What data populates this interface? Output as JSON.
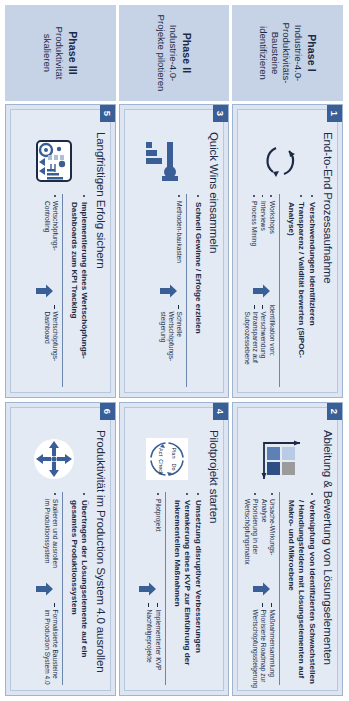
{
  "diagram": {
    "colors": {
      "panel_bg": "#e3eaf4",
      "panel_border": "#9fb4d0",
      "phase_label_bg": "#c6d3e6",
      "badge_bg": "#3a5f96",
      "accent": "#3a5f96",
      "divider": "#6d86ad",
      "text": "#1b2b46"
    },
    "phases": [
      {
        "id": "phase-1",
        "title": "Phase I",
        "subtitle": "Industrie-4.0-Produktivitäts-Bausteine identifizieren",
        "cards": [
          {
            "number": "1",
            "title": "End-to-End Prozessaufnahme",
            "icon": "cycle-arrows-icon",
            "bullets": [
              "Verschwendungen identifizieren",
              "Transparenz / Validität bewerten (SIPOC-Analyse)"
            ],
            "sub_left": [
              "Workshops",
              "Interviews",
              "Process Mining"
            ],
            "sub_left_style": "dot",
            "sub_right_heading": "Identifikation von:",
            "sub_right": [
              "Verschwendung",
              "Intransparenz auf Subprozessebene"
            ],
            "sub_right_style": "dash"
          },
          {
            "number": "2",
            "title": "Ableitung & Bewertung von Lösungselementen",
            "icon": "matrix-quadrant-icon",
            "bullets": [
              "Verknüpfung von identifizierten Schwachstellen / Handlungsfeldern mit Lösungselementen auf Makro- und Mikroebene"
            ],
            "sub_left": [
              "Ursache-Wirkungs-Analyse",
              "Priorisierung in der Wertschöpfungsmatrix"
            ],
            "sub_left_style": "dot",
            "sub_right_heading": "",
            "sub_right": [
              "Maßnahmensammlung",
              "Priorisierte Roadmap zur Wertschöpfungssteigerung"
            ],
            "sub_right_style": "dash"
          }
        ]
      },
      {
        "id": "phase-2",
        "title": "Phase II",
        "subtitle": "Industrie-4.0-Projekte pilotieren",
        "cards": [
          {
            "number": "3",
            "title": "Quick Wins einsammeln",
            "icon": "hammer-bars-icon",
            "bullets": [
              "Schnell Gewinne / Erfolge erzielen"
            ],
            "sub_left": [
              "Methoden-baukasten"
            ],
            "sub_left_style": "dot",
            "sub_right_heading": "",
            "sub_right": [
              "Schnelle Wertschöpfungs-steigerung"
            ],
            "sub_right_style": "dash"
          },
          {
            "number": "4",
            "title": "Pilotprojekt starten",
            "icon": "pdca-cycle-icon",
            "bullets": [
              "Umsetzung disruptiver Verbesserungen",
              "Verankerung eines KVP zur Einführung der inkrementellen Maßnahmen"
            ],
            "sub_left": [
              "Pilotprojekt"
            ],
            "sub_left_style": "dot",
            "sub_right_heading": "",
            "sub_right": [
              "Implementierter KVP",
              "Nachfolgeprojekte"
            ],
            "sub_right_style": "dash"
          }
        ]
      },
      {
        "id": "phase-3",
        "title": "Phase III",
        "subtitle": "Produktivität skalieren",
        "cards": [
          {
            "number": "5",
            "title": "Langfristigen Erfolg sichern",
            "icon": "dashboard-icon",
            "bullets": [
              "Implementierung eines Wertschöpfungs-Dashboards zum KPI Tracking"
            ],
            "sub_left": [
              "Wertschöpfungs-Controlling"
            ],
            "sub_left_style": "dot",
            "sub_right_heading": "",
            "sub_right": [
              "Wertschöpfungs-Dashboard"
            ],
            "sub_right_style": "dash"
          },
          {
            "number": "6",
            "title": "Produktivität im Production System 4.0 ausrollen",
            "icon": "four-way-expand-icon",
            "bullets": [
              "Übertragen der Lösungselemente auf ein gesamtes Produktionssystem"
            ],
            "sub_left": [
              "Skalieren und ausrollen im Produktionssystem"
            ],
            "sub_left_style": "dot",
            "sub_right_heading": "",
            "sub_right": [
              "Formalisierte Bausteine im Production System 4.0"
            ],
            "sub_right_style": "dash"
          }
        ]
      }
    ],
    "pdca_labels": {
      "plan": "Plan",
      "do": "Do",
      "check": "Check",
      "act": "Act"
    }
  }
}
